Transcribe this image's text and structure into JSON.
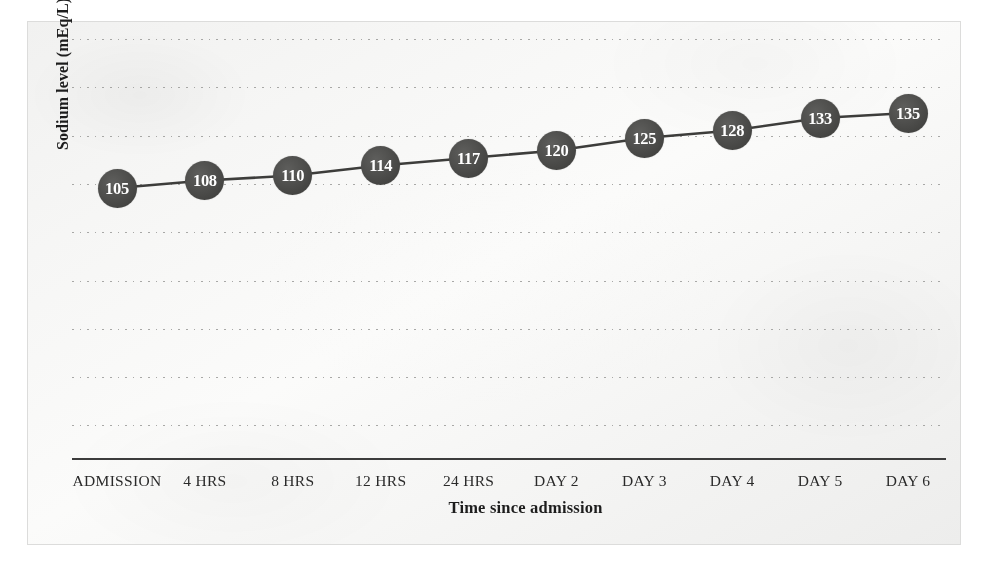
{
  "figure": {
    "kind": "scanned-line-chart",
    "background_color": "#f6f6f5",
    "frame_border_color": "#dcdcdb",
    "marker_color": "#4a4a48",
    "marker_text_color": "#ffffff",
    "line_color": "#3d3d3b",
    "gridline_color": "#9a9a98",
    "axis_color": "#3c3c3c"
  },
  "chart_data": {
    "type": "line",
    "title": "",
    "xlabel": "Time since admission",
    "ylabel": "Sodium level (mEq/L)",
    "categories": [
      "ADMISSION",
      "4 HRS",
      "8 HRS",
      "12 HRS",
      "24 HRS",
      "DAY 2",
      "DAY 3",
      "DAY 4",
      "DAY 5",
      "DAY 6"
    ],
    "values": [
      105,
      108,
      110,
      114,
      117,
      120,
      125,
      128,
      133,
      135
    ],
    "point_labels": [
      "105",
      "108",
      "110",
      "114",
      "117",
      "120",
      "125",
      "128",
      "133",
      "135"
    ],
    "series": [
      {
        "name": "Sodium level",
        "values": [
          105,
          108,
          110,
          114,
          117,
          120,
          125,
          128,
          133,
          135
        ]
      }
    ],
    "ylim": [
      98,
      139
    ],
    "yticks": [],
    "ytick_labels": [],
    "grid": true,
    "grid_orientation": "horizontal",
    "grid_style": "dotted",
    "grid_count": 9,
    "legend": false,
    "legend_position": "none",
    "markers": "filled-circle-with-value-label",
    "annotations": []
  },
  "axes": {
    "y_title": "Sodium level (mEq/L)",
    "x_title": "Time since admission",
    "x_tick_labels": [
      "ADMISSION",
      "4 HRS",
      "8 HRS",
      "12 HRS",
      "24 HRS",
      "DAY 2",
      "DAY 3",
      "DAY 4",
      "DAY 5",
      "DAY 6"
    ]
  }
}
